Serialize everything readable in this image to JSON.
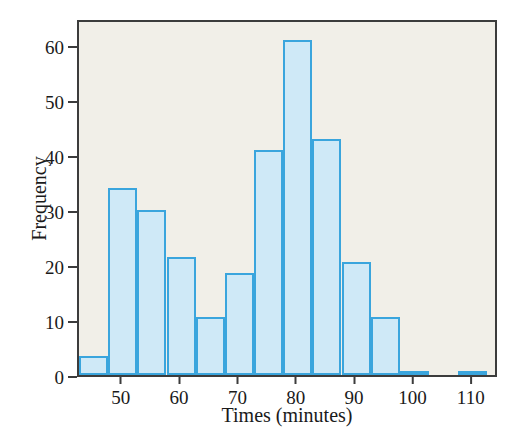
{
  "figure": {
    "background_color": "#ffffff",
    "plot_background_color": "#f1efe8",
    "frame_color": "#3c3c3c"
  },
  "chart_data": {
    "type": "bar",
    "subtype": "histogram",
    "title": "",
    "xlabel": "Times (minutes)",
    "ylabel": "Frequency",
    "xlim": [
      42.5,
      114.5
    ],
    "ylim": [
      0,
      65
    ],
    "grid": false,
    "legend": null,
    "bar_fill_color": "#cfe9f7",
    "bar_edge_color": "#3aa5dd",
    "bin_width": 5,
    "x_ticks": [
      50,
      60,
      70,
      80,
      90,
      100,
      110
    ],
    "x_tick_labels": [
      "50",
      "60",
      "70",
      "80",
      "90",
      "100",
      "110"
    ],
    "y_ticks": [
      0,
      10,
      20,
      30,
      40,
      50,
      60
    ],
    "y_tick_labels": [
      "0",
      "10",
      "20",
      "30",
      "40",
      "50",
      "60"
    ],
    "bins": [
      {
        "start": 42.5,
        "end": 47.5,
        "value": 3.5
      },
      {
        "start": 47.5,
        "end": 52.5,
        "value": 34
      },
      {
        "start": 52.5,
        "end": 57.5,
        "value": 30
      },
      {
        "start": 57.5,
        "end": 62.5,
        "value": 21.5
      },
      {
        "start": 62.5,
        "end": 67.5,
        "value": 10.5
      },
      {
        "start": 67.5,
        "end": 72.5,
        "value": 18.5
      },
      {
        "start": 72.5,
        "end": 77.5,
        "value": 41
      },
      {
        "start": 77.5,
        "end": 82.5,
        "value": 61
      },
      {
        "start": 82.5,
        "end": 87.5,
        "value": 43
      },
      {
        "start": 87.5,
        "end": 92.5,
        "value": 20.5
      },
      {
        "start": 92.5,
        "end": 97.5,
        "value": 10.5
      },
      {
        "start": 97.5,
        "end": 102.5,
        "value": 0.5
      },
      {
        "start": 102.5,
        "end": 107.5,
        "value": 0
      },
      {
        "start": 107.5,
        "end": 112.5,
        "value": 0.5
      }
    ],
    "categories": [
      "42.5-47.5",
      "47.5-52.5",
      "52.5-57.5",
      "57.5-62.5",
      "62.5-67.5",
      "67.5-72.5",
      "72.5-77.5",
      "77.5-82.5",
      "82.5-87.5",
      "87.5-92.5",
      "92.5-97.5",
      "97.5-102.5",
      "102.5-107.5",
      "107.5-112.5"
    ],
    "values": [
      3.5,
      34,
      30,
      21.5,
      10.5,
      18.5,
      41,
      61,
      43,
      20.5,
      10.5,
      0.5,
      0,
      0.5
    ]
  }
}
